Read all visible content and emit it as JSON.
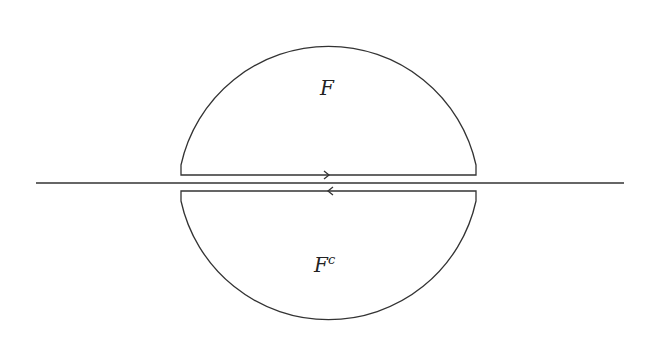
{
  "diagram": {
    "labels": {
      "upper_region": "F",
      "lower_region": "F",
      "lower_superscript": "c"
    },
    "colors": {
      "stroke": "#333333",
      "background": "#ffffff"
    },
    "elements": [
      "horizontal axis line",
      "upper half-disk contour with rightward arrow on flat edge",
      "lower half-disk contour with leftward arrow on flat edge"
    ]
  }
}
